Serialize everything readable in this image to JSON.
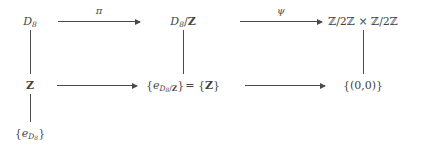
{
  "diagram": {
    "background_color": "#ffffff",
    "ink_color": "#434343",
    "nodes": {
      "top_left": "D8",
      "top_left_base": "D",
      "top_left_sub": "8",
      "top_center_base": "D",
      "top_center_sub": "8",
      "top_center_rest": "/",
      "top_center_bold": "Z",
      "top_right": "ℤ/2ℤ × ℤ/2ℤ",
      "mid_left": "Z",
      "mid_center_open": "{",
      "mid_center_e": "e",
      "mid_center_sub_base": "D",
      "mid_center_sub_sub": "8",
      "mid_center_sub_slash": "/",
      "mid_center_sub_bold": "Z",
      "mid_center_close": "}",
      "mid_center_eq": "= {",
      "mid_center_eq_bold": "Z",
      "mid_center_eq_close": "}",
      "mid_right": "{(0,0)}",
      "bottom_left_open": "{",
      "bottom_left_e": "e",
      "bottom_left_sub_base": "D",
      "bottom_left_sub_sub": "8",
      "bottom_left_close": "}"
    },
    "arrow_labels": {
      "pi": "π",
      "psi": "ψ"
    }
  }
}
